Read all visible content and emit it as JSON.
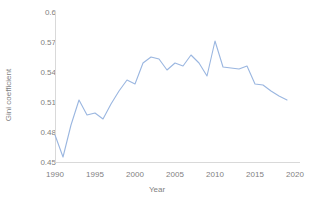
{
  "chart_data": {
    "type": "line",
    "title": "",
    "subtitle": "",
    "xlabel": "Year",
    "ylabel": "Gini coefficient",
    "xlim": [
      1990,
      2020
    ],
    "ylim": [
      0.45,
      0.6
    ],
    "xticks": [
      1990,
      1995,
      2000,
      2005,
      2010,
      2015,
      2020
    ],
    "xtick_labels": [
      "1990",
      "1995",
      "2000",
      "2005",
      "2010",
      "2015",
      "2020"
    ],
    "yticks": [
      0.45,
      0.48,
      0.51,
      0.54,
      0.57,
      0.6
    ],
    "ytick_labels": [
      "0.45",
      "0.48",
      "0.51",
      "0.54",
      "0.57",
      "0.6"
    ],
    "grid": false,
    "legend": false,
    "legend_position": "none",
    "line_color": "#9ab6e0",
    "axis_color": "#d9d9d9",
    "tick_label_color": "#7f7f7f",
    "x": [
      1990,
      1991,
      1992,
      1993,
      1994,
      1995,
      1996,
      1997,
      1998,
      1999,
      2000,
      2001,
      2002,
      2003,
      2004,
      2005,
      2006,
      2007,
      2008,
      2009,
      2010,
      2011,
      2012,
      2013,
      2014,
      2015,
      2016,
      2017,
      2018,
      2019
    ],
    "series": [
      {
        "name": "Gini coefficient",
        "values": [
          0.477,
          0.455,
          0.487,
          0.512,
          0.497,
          0.499,
          0.493,
          0.508,
          0.521,
          0.532,
          0.528,
          0.549,
          0.555,
          0.553,
          0.542,
          0.549,
          0.546,
          0.557,
          0.549,
          0.536,
          0.571,
          0.545,
          0.544,
          0.543,
          0.546,
          0.528,
          0.527,
          0.521,
          0.516,
          0.512
        ]
      }
    ]
  }
}
